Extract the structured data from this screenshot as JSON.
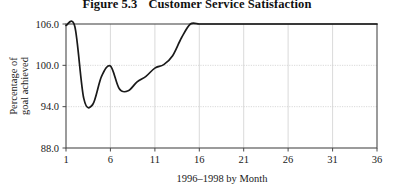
{
  "figure": {
    "number": "Figure 5.3",
    "title": "Customer Service Satisfaction"
  },
  "chart_data": {
    "type": "line",
    "title": "Customer Service Satisfaction",
    "xlabel": "1996–1998 by Month",
    "ylabel": "Percentage of goal achieved",
    "ylabel_line1": "Percentage of",
    "ylabel_line2": "goal achieved",
    "xlim": [
      1,
      36
    ],
    "ylim": [
      88.0,
      106.0
    ],
    "grid": true,
    "legend": "none",
    "y_ticks": [
      "106.0",
      "100.0",
      "94.0",
      "88.0"
    ],
    "y_tick_values": [
      106.0,
      100.0,
      94.0,
      88.0
    ],
    "x_ticks": [
      "1",
      "6",
      "11",
      "16",
      "21",
      "26",
      "31",
      "36"
    ],
    "x_tick_values": [
      1,
      6,
      11,
      16,
      21,
      26,
      31,
      36
    ],
    "x": [
      1,
      2,
      3,
      4,
      5,
      6,
      7,
      8,
      9,
      10,
      11,
      12,
      13,
      14,
      15,
      16,
      17,
      18,
      19,
      20,
      21,
      22,
      23,
      24,
      25,
      26,
      27,
      28,
      29,
      30,
      31,
      32,
      33,
      34,
      35,
      36
    ],
    "values": [
      105.8,
      105.6,
      95.2,
      94.3,
      98.4,
      99.9,
      96.6,
      96.3,
      97.6,
      98.4,
      99.6,
      100.1,
      101.4,
      104.0,
      106.0,
      106.0,
      106.0,
      106.0,
      106.0,
      106.0,
      106.0,
      106.0,
      106.0,
      106.0,
      106.0,
      106.0,
      106.0,
      106.0,
      106.0,
      106.0,
      106.0,
      106.0,
      106.0,
      106.0,
      106.0,
      106.0
    ],
    "series": [
      {
        "name": "Percentage of goal achieved",
        "color": "#1a1a1a",
        "values": [
          105.8,
          105.6,
          95.2,
          94.3,
          98.4,
          99.9,
          96.6,
          96.3,
          97.6,
          98.4,
          99.6,
          100.1,
          101.4,
          104.0,
          106.0,
          106.0,
          106.0,
          106.0,
          106.0,
          106.0,
          106.0,
          106.0,
          106.0,
          106.0,
          106.0,
          106.0,
          106.0,
          106.0,
          106.0,
          106.0,
          106.0,
          106.0,
          106.0,
          106.0,
          106.0,
          106.0
        ]
      }
    ]
  },
  "colors": {
    "line": "#1a1a1a",
    "axis": "#4a4a4a",
    "grid": "#cfcfcf",
    "background": "#ffffff"
  }
}
